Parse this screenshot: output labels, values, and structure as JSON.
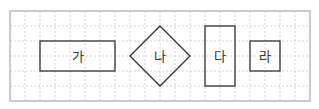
{
  "diagram": {
    "type": "shapes-on-grid",
    "grid": {
      "origin_x": 10,
      "origin_y": 11,
      "cell_size": 15,
      "columns": 20,
      "rows": 6,
      "border_color": "#aaaaaa",
      "line_color": "#c8c8c8"
    },
    "stroke_color": "#333333",
    "shapes": [
      {
        "id": "ga",
        "kind": "rectangle",
        "label": "가",
        "col": 2,
        "row": 2,
        "width_cells": 5,
        "height_cells": 2
      },
      {
        "id": "na",
        "kind": "diamond",
        "label": "나",
        "center_col": 10,
        "center_row": 3,
        "half_cells": 2
      },
      {
        "id": "da",
        "kind": "rectangle",
        "label": "다",
        "col": 13,
        "row": 1,
        "width_cells": 2,
        "height_cells": 4
      },
      {
        "id": "ra",
        "kind": "square",
        "label": "라",
        "col": 16,
        "row": 2,
        "width_cells": 2,
        "height_cells": 2
      }
    ]
  }
}
